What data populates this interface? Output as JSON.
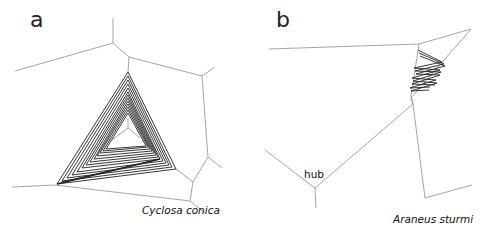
{
  "panels": [
    {
      "id": "a",
      "label": "a",
      "species": "Cyclosa conica",
      "description": "Web with concentric triangular spiral around the hub"
    },
    {
      "id": "b",
      "label": "b",
      "species": "Araneus sturmi",
      "hub_label": "hub",
      "description": "Web with zigzag spiral in a distal triangular sector"
    }
  ],
  "colors": {
    "frame_threads": "#9a9a9a",
    "spiral_threads": "#222222",
    "background": "#ffffff"
  }
}
